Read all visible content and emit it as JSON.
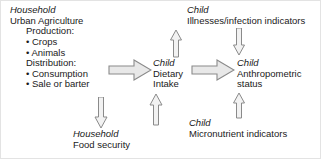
{
  "diagram": {
    "colors": {
      "text": "#1a1a1a",
      "arrow_fill": "#e8e8e8",
      "arrow_stroke": "#8a8a8a",
      "background": "#ffffff",
      "border": "#e3e3e3"
    },
    "nodes": [
      {
        "id": "household-urban-agriculture",
        "italic_label": "Household",
        "plain_label": "Urban Agriculture",
        "lines": [
          "Production:",
          "• Crops",
          "• Animals",
          "Distribution:",
          "• Consumption",
          "• Sale or barter"
        ]
      },
      {
        "id": "child-dietary-intake",
        "italic_label": "Child",
        "plain_label": "Dietary",
        "plain_label2": "Intake"
      },
      {
        "id": "child-illnesses",
        "italic_label": "Child",
        "plain_label": "Illnesses/infection indicators"
      },
      {
        "id": "child-anthropometric",
        "italic_label": "Child",
        "plain_label": "Anthropometric",
        "plain_label2": "status"
      },
      {
        "id": "child-micronutrient",
        "italic_label": "Child",
        "plain_label": "Micronutrient indicators"
      },
      {
        "id": "household-food-security",
        "italic_label": "Household",
        "plain_label": "Food security"
      }
    ],
    "arrows": [
      {
        "id": "ua-to-dietary",
        "style": "block",
        "direction": "right"
      },
      {
        "id": "dietary-to-anthropometric",
        "style": "block",
        "direction": "right"
      },
      {
        "id": "ua-to-food-security",
        "style": "line",
        "direction": "down"
      },
      {
        "id": "food-security-to-dietary",
        "style": "line",
        "direction": "up"
      },
      {
        "id": "dietary-to-illnesses",
        "style": "line",
        "direction": "up"
      },
      {
        "id": "illnesses-to-anthropometric",
        "style": "line",
        "direction": "down"
      },
      {
        "id": "micronutrient-to-anthropometric",
        "style": "line",
        "direction": "up"
      }
    ]
  }
}
